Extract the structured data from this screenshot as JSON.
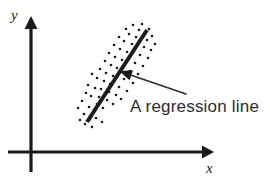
{
  "figure": {
    "background_color": "#ffffff",
    "ink_color": "#1a1a1a"
  },
  "axes": {
    "x_label": "x",
    "y_label": "y",
    "x_axis": {
      "x1": 8,
      "y1": 152,
      "x2": 214,
      "y2": 152,
      "arrow": "right"
    },
    "y_axis": {
      "x1": 31,
      "y1": 172,
      "x2": 31,
      "y2": 16,
      "arrow": "up"
    },
    "x_label_pos": {
      "x": 206,
      "y": 173
    },
    "y_label_pos": {
      "x": 11,
      "y": 20
    }
  },
  "annotation": {
    "label": "A regression line",
    "label_pos": {
      "x": 130,
      "y": 112
    },
    "leader_line": {
      "x1": 186,
      "y1": 94,
      "x2": 123,
      "y2": 73
    },
    "arrow_tip": {
      "x": 119,
      "y": 71
    },
    "arrow_color": "#1a1a1a"
  },
  "chart_data": {
    "type": "scatter",
    "title": "",
    "xlabel": "x",
    "ylabel": "y",
    "xlim": [
      0,
      270
    ],
    "ylim": [
      0,
      192
    ],
    "grid": false,
    "legend": null,
    "annotations": [
      {
        "text": "A regression line",
        "points_to": "regression-line"
      }
    ],
    "regression_line": {
      "label": "A regression line",
      "x1": 87,
      "y1": 122,
      "x2": 147,
      "y2": 30,
      "stroke_width": 4,
      "color": "#1a1a1a"
    },
    "points": [
      [
        84,
        114
      ],
      [
        89,
        107
      ],
      [
        82,
        101
      ],
      [
        94,
        112
      ],
      [
        97,
        104
      ],
      [
        91,
        96
      ],
      [
        86,
        93
      ],
      [
        99,
        97
      ],
      [
        103,
        108
      ],
      [
        107,
        100
      ],
      [
        95,
        88
      ],
      [
        88,
        85
      ],
      [
        101,
        89
      ],
      [
        109,
        92
      ],
      [
        113,
        104
      ],
      [
        104,
        81
      ],
      [
        97,
        78
      ],
      [
        92,
        74
      ],
      [
        110,
        84
      ],
      [
        116,
        95
      ],
      [
        106,
        73
      ],
      [
        100,
        69
      ],
      [
        113,
        76
      ],
      [
        119,
        87
      ],
      [
        121,
        99
      ],
      [
        111,
        65
      ],
      [
        105,
        61
      ],
      [
        117,
        68
      ],
      [
        124,
        79
      ],
      [
        127,
        91
      ],
      [
        115,
        57
      ],
      [
        109,
        53
      ],
      [
        122,
        60
      ],
      [
        130,
        71
      ],
      [
        133,
        83
      ],
      [
        120,
        49
      ],
      [
        114,
        45
      ],
      [
        127,
        52
      ],
      [
        135,
        63
      ],
      [
        138,
        74
      ],
      [
        124,
        41
      ],
      [
        119,
        37
      ],
      [
        132,
        44
      ],
      [
        140,
        55
      ],
      [
        143,
        66
      ],
      [
        129,
        34
      ],
      [
        136,
        37
      ],
      [
        144,
        47
      ],
      [
        148,
        58
      ],
      [
        126,
        29
      ],
      [
        139,
        30
      ],
      [
        147,
        40
      ],
      [
        151,
        50
      ],
      [
        133,
        25
      ],
      [
        142,
        24
      ],
      [
        80,
        120
      ],
      [
        85,
        124
      ],
      [
        78,
        108
      ],
      [
        90,
        119
      ],
      [
        152,
        36
      ],
      [
        149,
        29
      ],
      [
        155,
        44
      ],
      [
        96,
        118
      ],
      [
        102,
        122
      ],
      [
        92,
        127
      ]
    ],
    "point_radius": 1.3,
    "point_color": "#1a1a1a"
  }
}
